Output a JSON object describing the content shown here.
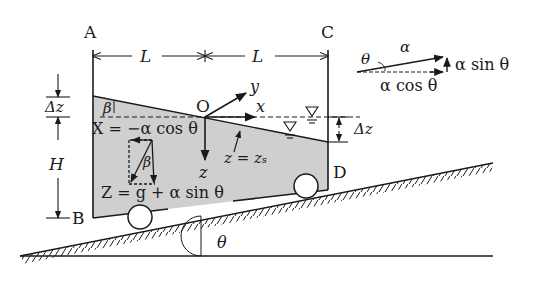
{
  "diagram": {
    "colors": {
      "ink": "#1a1a1a",
      "fluid": "#cfcfcf",
      "background": "#ffffff"
    },
    "corners": {
      "A": "A",
      "B": "B",
      "C": "C",
      "D": "D",
      "O": "O"
    },
    "dimensions": {
      "L_left": "L",
      "L_right": "L",
      "delta_z_left": "Δz",
      "delta_z_right": "Δz",
      "H": "H"
    },
    "axes": {
      "x": "x",
      "y": "y",
      "z": "z"
    },
    "labels": {
      "beta_top": "β",
      "beta_vector": "β",
      "X_eq": "X = −α cos θ",
      "Z_eq": "Z = g + α sin θ",
      "surface_eq": "z = zₛ",
      "incline_angle": "θ"
    },
    "inset": {
      "theta": "θ",
      "alpha": "α",
      "alpha_sin": "α sin θ",
      "alpha_cos": "α cos θ"
    },
    "symbols": {
      "free_surface_icon": "water-level-triangle"
    }
  }
}
